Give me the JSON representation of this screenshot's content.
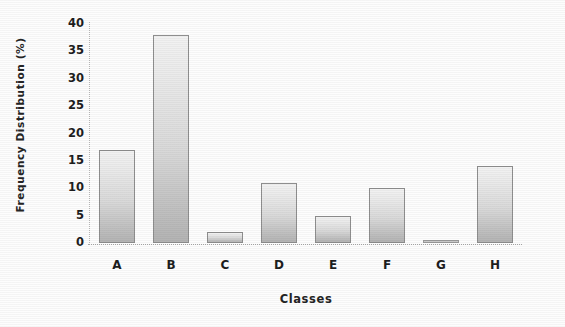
{
  "chart_data": {
    "type": "bar",
    "title": "",
    "xlabel": "Classes",
    "ylabel": "Frequency Distribution (%)",
    "categories": [
      "A",
      "B",
      "C",
      "D",
      "E",
      "F",
      "G",
      "H"
    ],
    "values": [
      17,
      38,
      2,
      11,
      5,
      10,
      0.5,
      14
    ],
    "ylim": [
      0,
      40
    ],
    "ytick_labels": [
      "40",
      "35",
      "30",
      "25",
      "20",
      "15",
      "10",
      "5",
      "0"
    ],
    "ytick_values": [
      40,
      35,
      30,
      25,
      20,
      15,
      10,
      5,
      0
    ],
    "ytick_step": 5,
    "grid": false,
    "legend": null,
    "series": [
      {
        "name": "Frequency Distribution (%)",
        "values": [
          17,
          38,
          2,
          11,
          5,
          10,
          0.5,
          14
        ]
      }
    ],
    "bar_fill": "#d9d9d9",
    "bar_edge": "#8e8e8e",
    "background": "#fdfdfd"
  }
}
